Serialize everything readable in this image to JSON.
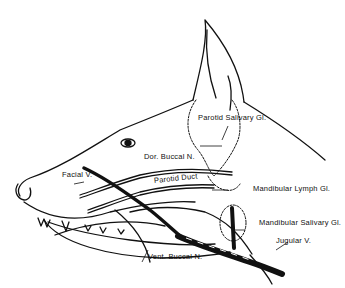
{
  "figure": {
    "labels": {
      "parotid_salivary_gl": "Parotid Salivary Gl.",
      "dor_buccal_n": "Dor. Buccal N.",
      "facial_v": "Facial V.",
      "parotid_duct": "Parotid Duct",
      "mandibular_lymph_gl": "Mandibular Lymph Gl.",
      "mandibular_salivary_gl": "Mandibular Salivary Gl.",
      "jugular_v": "Jugular V.",
      "vent_buccal_n": "Vent. Buccal N."
    }
  }
}
